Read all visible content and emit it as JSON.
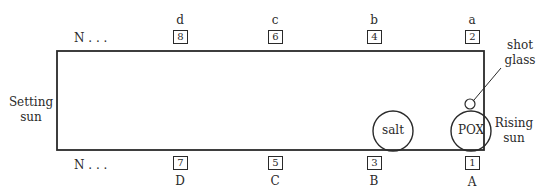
{
  "diagram": {
    "left_label": [
      "Setting",
      "sun"
    ],
    "right_label": [
      "Rising",
      "sun"
    ],
    "shot_glass_label": [
      "shot",
      "glass"
    ],
    "top_row": {
      "start_label": "N . . .",
      "positions": [
        {
          "letter": "d",
          "number": "8"
        },
        {
          "letter": "c",
          "number": "6"
        },
        {
          "letter": "b",
          "number": "4"
        },
        {
          "letter": "a",
          "number": "2"
        }
      ]
    },
    "bottom_row": {
      "start_label": "N . . .",
      "positions": [
        {
          "letter": "D",
          "number": "7"
        },
        {
          "letter": "C",
          "number": "5"
        },
        {
          "letter": "B",
          "number": "3"
        },
        {
          "letter": "A",
          "number": "1"
        }
      ]
    },
    "circles": [
      {
        "label": "salt"
      },
      {
        "label": "POX"
      }
    ],
    "colors": {
      "stroke": "#2a2a2a",
      "background": "#ffffff"
    }
  }
}
